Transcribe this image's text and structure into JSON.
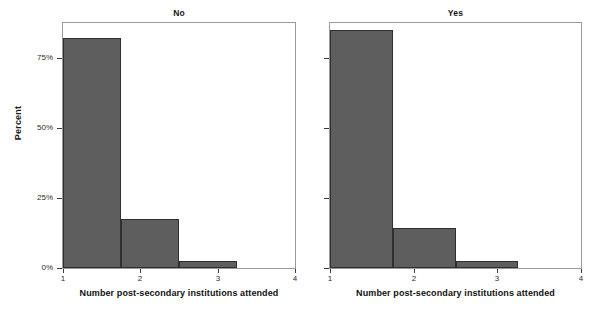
{
  "chart_data": {
    "type": "bar",
    "title": "",
    "subtitle": "",
    "xlabel": "Number post-secondary institutions attended",
    "ylabel": "Percent",
    "xlim": [
      1,
      4
    ],
    "ylim": [
      0,
      87.5
    ],
    "grid": false,
    "legend": null,
    "xticks": [
      "1",
      "2",
      "3",
      "4"
    ],
    "xtick_values": [
      1,
      2,
      3,
      4
    ],
    "yticks": [
      "0%",
      "25%",
      "50%",
      "75%"
    ],
    "ytick_values": [
      0,
      25,
      50,
      75
    ],
    "bin_width": 0.75,
    "bar_color": "#5e5e5e",
    "bar_edge_color": "#2f2f2f",
    "axis_color": "#9a9a9a",
    "panels": [
      {
        "label": "No",
        "categories": [
          "1",
          "2",
          "3"
        ],
        "bin_starts": [
          1.0,
          1.75,
          2.5
        ],
        "values": [
          82.0,
          17.5,
          2.4
        ]
      },
      {
        "label": "Yes",
        "categories": [
          "1",
          "2",
          "3"
        ],
        "bin_starts": [
          1.0,
          1.75,
          2.5
        ],
        "values": [
          85.0,
          14.4,
          2.4
        ]
      }
    ]
  }
}
